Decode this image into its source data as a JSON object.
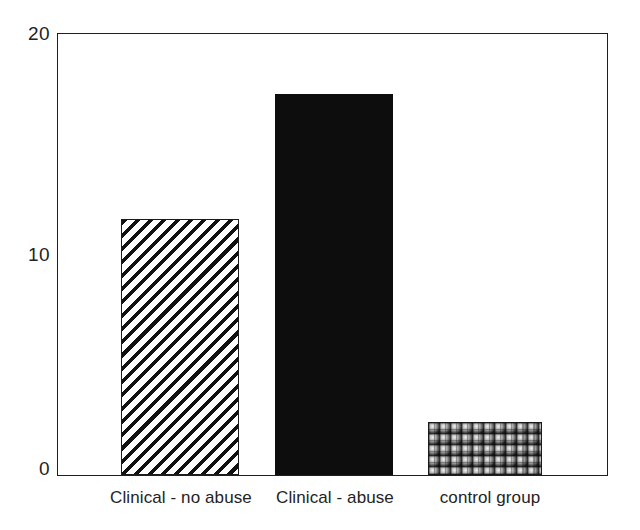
{
  "chart_data": {
    "type": "bar",
    "title": "",
    "subtitle": "",
    "xlabel": "",
    "ylabel": "",
    "categories": [
      "Clinical - no abuse",
      "Clinical - abuse",
      "control group"
    ],
    "values": [
      11.6,
      17.3,
      2.4
    ],
    "ylim": [
      0,
      20
    ],
    "yticks": [
      "0",
      "10",
      "20"
    ],
    "ytick_values": [
      0,
      10,
      20
    ],
    "grid": false,
    "legend": null,
    "bar_fills": [
      "diagonal-hatch",
      "solid-black",
      "checkered-spheres"
    ],
    "frame": "box"
  },
  "axes": {
    "y_tick_labels": [
      {
        "text": "20",
        "value": 20
      },
      {
        "text": "10",
        "value": 10
      },
      {
        "text": "0",
        "value": 0
      }
    ]
  },
  "bars": [
    {
      "label": "Clinical - no abuse",
      "value": 11.6,
      "fill": "diagonal-hatch"
    },
    {
      "label": "Clinical - abuse",
      "value": 17.3,
      "fill": "solid-black"
    },
    {
      "label": "control group",
      "value": 2.4,
      "fill": "checkered-spheres"
    }
  ],
  "colors": {
    "ink": "#1a1a1a",
    "background": "#ffffff",
    "bar_solid": "#0d0d0d"
  }
}
